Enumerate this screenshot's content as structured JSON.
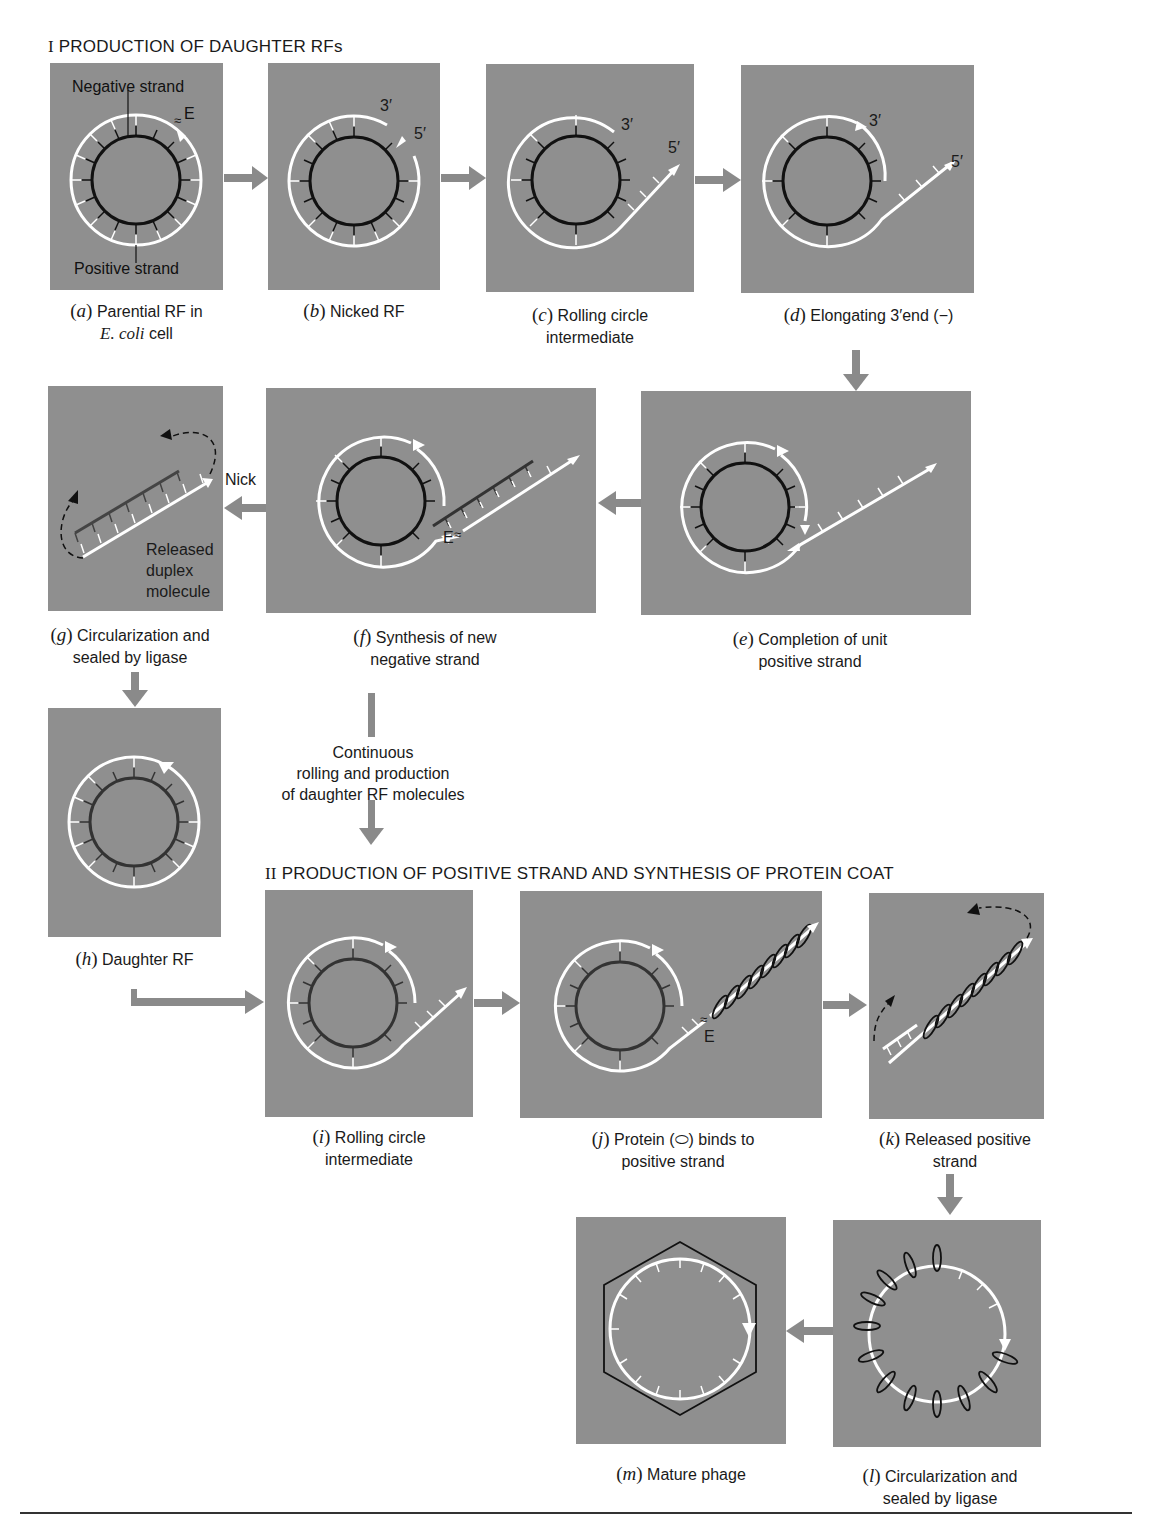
{
  "figure": {
    "sections": [
      {
        "numeral": "I",
        "title": "PRODUCTION OF DAUGHTER RFs"
      },
      {
        "numeral": "II",
        "title": "PRODUCTION OF POSITIVE STRAND AND SYNTHESIS OF PROTEIN COAT"
      }
    ],
    "colors": {
      "panel_bg": "#8f8f8f",
      "negative_strand": "#111111",
      "positive_strand": "#ffffff",
      "arrow": "#8a8a8a",
      "page_bg": "#ffffff"
    },
    "panels": {
      "a": {
        "letter": "a",
        "caption_line1": "Parential RF in",
        "caption_italic": "E. coli",
        "caption_line2_rest": " cell",
        "labels": {
          "negative": "Negative strand",
          "positive": "Positive strand",
          "enzyme": "E"
        }
      },
      "b": {
        "letter": "b",
        "caption_line1": "Nicked RF",
        "labels": {
          "three_prime": "3′",
          "five_prime": "5′"
        }
      },
      "c": {
        "letter": "c",
        "caption_line1": "Rolling circle",
        "caption_line2": "intermediate",
        "labels": {
          "three_prime": "3′",
          "five_prime": "5′"
        }
      },
      "d": {
        "letter": "d",
        "caption_line1": "Elongating 3′end (−)",
        "labels": {
          "three_prime": "3′",
          "five_prime": "5′"
        }
      },
      "e": {
        "letter": "e",
        "caption_line1": "Completion of unit",
        "caption_line2": "positive strand"
      },
      "f": {
        "letter": "f",
        "caption_line1": "Synthesis of new",
        "caption_line2": "negative strand",
        "labels": {
          "enzyme": "E"
        }
      },
      "g": {
        "letter": "g",
        "caption_line1": "Circularization and",
        "caption_line2": "sealed by ligase",
        "labels": {
          "released_1": "Released",
          "released_2": "duplex",
          "released_3": "molecule"
        }
      },
      "h": {
        "letter": "h",
        "caption_line1": "Daughter RF"
      },
      "i": {
        "letter": "i",
        "caption_line1": "Rolling circle",
        "caption_line2": "intermediate"
      },
      "j": {
        "letter": "j",
        "caption_line1": "Protein (⬭) binds to",
        "caption_line2": "positive strand",
        "labels": {
          "enzyme": "E"
        }
      },
      "k": {
        "letter": "k",
        "caption_line1": "Released positive",
        "caption_line2": "strand"
      },
      "l": {
        "letter": "l",
        "caption_line1": "Circularization and",
        "caption_line2": "sealed by ligase"
      },
      "m": {
        "letter": "m",
        "caption_line1": "Mature phage"
      }
    },
    "annotations": {
      "nick": "Nick",
      "continuous_1": "Continuous",
      "continuous_2": "rolling and production",
      "continuous_3": "of daughter RF molecules"
    },
    "flow": [
      "a→b",
      "b→c",
      "c→d",
      "d→e",
      "e→f",
      "f→g (Nick)",
      "g→h",
      "h→i",
      "f→i (Continuous rolling)",
      "i→j",
      "j→k",
      "k→l",
      "l→m"
    ]
  }
}
